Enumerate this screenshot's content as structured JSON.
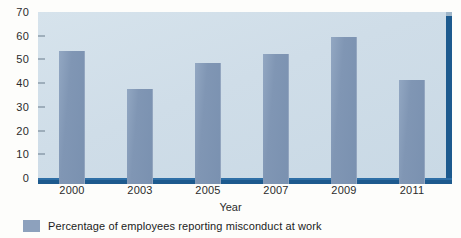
{
  "chart_data": {
    "type": "bar",
    "title": "",
    "subtitle": "",
    "categories": [
      "2000",
      "2003",
      "2005",
      "2007",
      "2009",
      "2011"
    ],
    "values": [
      56,
      40,
      51,
      55,
      62,
      44
    ],
    "series": [
      {
        "name": "Percentage of employees reporting misconduct at work",
        "values": [
          56,
          40,
          51,
          55,
          62,
          44
        ]
      }
    ],
    "xlabel": "Year",
    "ylabel": "",
    "ylim": [
      0,
      70
    ],
    "yticks": [
      0,
      10,
      20,
      30,
      40,
      50,
      60,
      70
    ],
    "ytick_labels": [
      "0",
      "10",
      "20",
      "30",
      "40",
      "50",
      "60",
      "70"
    ],
    "grid": false,
    "legend_position": "bottom-left",
    "legend": [
      "Percentage of employees reporting misconduct at work"
    ],
    "annotations": [],
    "colors": {
      "bar": "#7a91b0",
      "plot_background": "#cfdde8",
      "axis_edge": "#1d5a8e",
      "legend_swatch": "#8da1bd",
      "text": "#2b2b2b",
      "page_background": "#fdfdfb"
    }
  },
  "legend": {
    "swatch_name": "legend-color-swatch",
    "label": "Percentage of employees reporting misconduct at work"
  },
  "axes": {
    "x_title": "Year"
  }
}
